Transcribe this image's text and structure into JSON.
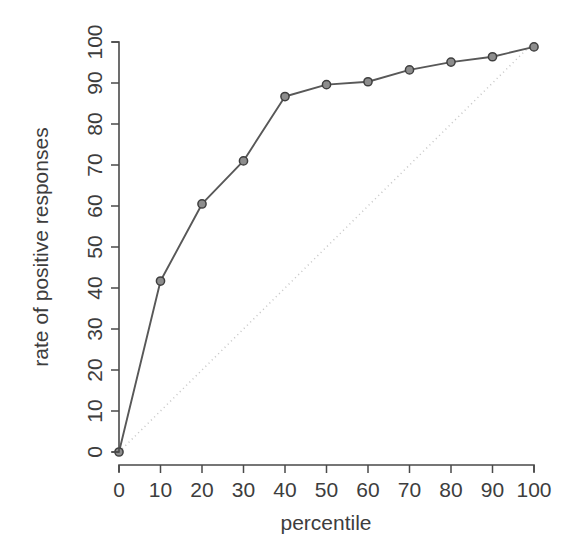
{
  "figure": {
    "background_color": "#ffffff",
    "series_color": "#585858",
    "marker_fill_color": "#8d8d8d",
    "marker_edge_color": "#3f3f3f",
    "reference_line_color": "#c9c9c9",
    "axis_color": "#4a4a4a",
    "text_color": "#3d3d3d"
  },
  "chart_data": {
    "type": "line",
    "title": "",
    "subtitle": "",
    "xlabel": "percentile",
    "ylabel": "rate of positive responses",
    "xlim": [
      0,
      100
    ],
    "ylim": [
      0,
      100
    ],
    "xticks": [
      0,
      10,
      20,
      30,
      40,
      50,
      60,
      70,
      80,
      90,
      100
    ],
    "yticks": [
      0,
      10,
      20,
      30,
      40,
      50,
      60,
      70,
      80,
      90,
      100
    ],
    "xtick_labels": [
      "0",
      "10",
      "20",
      "30",
      "40",
      "50",
      "60",
      "70",
      "80",
      "90",
      "100"
    ],
    "ytick_labels": [
      "0",
      "10",
      "20",
      "30",
      "40",
      "50",
      "60",
      "70",
      "80",
      "90",
      "100"
    ],
    "ytick_label_rotation": -90,
    "grid": false,
    "legend": null,
    "legend_position": "none",
    "x": [
      0,
      10,
      20,
      30,
      40,
      50,
      60,
      70,
      80,
      90,
      100
    ],
    "values": [
      0,
      41.7,
      60.5,
      71.0,
      86.7,
      89.6,
      90.3,
      93.2,
      95.1,
      96.4,
      98.8
    ],
    "series": [
      {
        "name": "gain curve",
        "marker": "filled-circle",
        "linestyle": "solid",
        "values": [
          0,
          41.7,
          60.5,
          71.0,
          86.7,
          89.6,
          90.3,
          93.2,
          95.1,
          96.4,
          98.8
        ]
      },
      {
        "name": "reference diagonal",
        "marker": "none",
        "linestyle": "dotted",
        "x": [
          0,
          100
        ],
        "values": [
          0,
          100
        ]
      }
    ],
    "annotations": []
  },
  "axes": {
    "x_axis_label": "percentile",
    "y_axis_label": "rate of positive responses"
  }
}
